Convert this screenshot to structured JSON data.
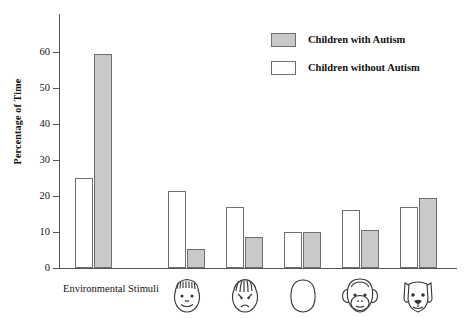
{
  "chart_data": {
    "type": "bar",
    "title": "",
    "subtitle": "",
    "xlabel": "",
    "ylabel": "Percentage of Time",
    "ylim": [
      0,
      65
    ],
    "yticks": [
      0,
      10,
      20,
      30,
      40,
      50,
      60
    ],
    "ytick_labels": [
      "0",
      "10",
      "20",
      "30",
      "40",
      "50",
      "60"
    ],
    "grid": false,
    "legend_position": "top-right",
    "categories": [
      "Environmental Stimuli",
      "Happy Face",
      "Sad Face",
      "Blank Face",
      "Monkey Face",
      "Dog Face"
    ],
    "category_icons": [
      "none",
      "happy-face-icon",
      "sad-face-icon",
      "blank-face-icon",
      "monkey-face-icon",
      "dog-face-icon"
    ],
    "series": [
      {
        "name": "Children without Autism",
        "color": "#ffffff",
        "values": [
          25,
          21.5,
          17,
          10,
          16,
          17
        ]
      },
      {
        "name": "Children with Autism",
        "color": "#c9c9c9",
        "values": [
          59.5,
          5.2,
          8.5,
          10,
          10.5,
          19.5
        ]
      }
    ]
  },
  "legend": {
    "items": [
      {
        "label": "Children with Autism",
        "swatch": "gray"
      },
      {
        "label": "Children without Autism",
        "swatch": "white"
      }
    ]
  },
  "axis": {
    "y_title": "Percentage of Time",
    "y_tick_labels": [
      "60",
      "50",
      "40",
      "30",
      "20",
      "10",
      "0"
    ]
  },
  "x_axis": {
    "first_label": "Environmental Stimuli"
  }
}
